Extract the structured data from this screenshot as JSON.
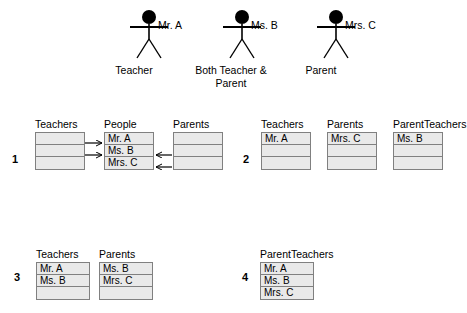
{
  "legend": {
    "figures": [
      {
        "name": "Mr. A",
        "role": "Teacher",
        "x": 126,
        "name_x": 158,
        "role_x": 94,
        "role_w": 80
      },
      {
        "name": "Ms. B",
        "role": "Both Teacher &\nParent",
        "x": 219,
        "name_x": 251,
        "role_x": 183,
        "role_w": 96
      },
      {
        "name": "Mrs. C",
        "role": "Parent",
        "x": 313,
        "name_x": 345,
        "role_x": 281,
        "role_w": 80
      }
    ],
    "figure_icon": "stick-figure-icon"
  },
  "sections": [
    {
      "id": "section-1",
      "number": "1",
      "number_x": 12,
      "number_y": 153,
      "top": 118,
      "tables": [
        {
          "title": "Teachers",
          "x": 35,
          "width": 50,
          "rows": [
            "",
            "",
            ""
          ]
        },
        {
          "title": "People",
          "x": 104,
          "width": 50,
          "rows": [
            "Mr. A",
            "Ms. B",
            "Mrs. C"
          ]
        },
        {
          "title": "Parents",
          "x": 173,
          "width": 50,
          "rows": [
            "",
            "",
            ""
          ]
        }
      ]
    },
    {
      "id": "section-2",
      "number": "2",
      "number_x": 243,
      "number_y": 153,
      "top": 118,
      "tables": [
        {
          "title": "Teachers",
          "x": 261,
          "width": 50,
          "rows": [
            "Mr. A",
            "",
            ""
          ]
        },
        {
          "title": "Parents",
          "x": 327,
          "width": 50,
          "rows": [
            "Mrs. C",
            "",
            ""
          ]
        },
        {
          "title": "ParentTeachers",
          "x": 393,
          "width": 50,
          "rows": [
            "Ms. B",
            "",
            ""
          ]
        }
      ]
    },
    {
      "id": "section-3",
      "number": "3",
      "number_x": 14,
      "number_y": 271,
      "top": 248,
      "tables": [
        {
          "title": "Teachers",
          "x": 36,
          "width": 54,
          "rows": [
            "Mr. A",
            "Ms. B",
            ""
          ]
        },
        {
          "title": "Parents",
          "x": 99,
          "width": 54,
          "rows": [
            "Ms. B",
            "Mrs. C",
            ""
          ]
        }
      ]
    },
    {
      "id": "section-4",
      "number": "4",
      "number_x": 242,
      "number_y": 271,
      "top": 248,
      "tables": [
        {
          "title": "ParentTeachers",
          "x": 260,
          "width": 54,
          "rows": [
            "Mr. A",
            "Ms. B",
            "Mrs. C"
          ]
        }
      ]
    }
  ],
  "arrows": [
    {
      "name": "arrow-teachers-to-mr-a",
      "x1": 85,
      "y1": 143,
      "x2": 102,
      "y2": 143,
      "dir": "right"
    },
    {
      "name": "arrow-teachers-to-ms-b",
      "x1": 85,
      "y1": 155,
      "x2": 102,
      "y2": 155,
      "dir": "right"
    },
    {
      "name": "arrow-parents-to-ms-b",
      "x1": 172,
      "y1": 155,
      "x2": 156,
      "y2": 155,
      "dir": "left"
    },
    {
      "name": "arrow-parents-to-mrs-c",
      "x1": 172,
      "y1": 167,
      "x2": 156,
      "y2": 167,
      "dir": "left"
    }
  ],
  "colors": {
    "cell_fill": "#e9e9e9",
    "border": "#808080",
    "text": "#000000",
    "stroke": "#000000",
    "background": "#ffffff"
  }
}
